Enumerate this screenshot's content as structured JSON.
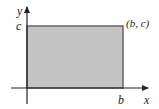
{
  "diagram": {
    "type": "rectangle-region",
    "axes": {
      "x_label": "x",
      "y_label": "y"
    },
    "ticks": {
      "x_tick": "b",
      "y_tick": "c"
    },
    "corner_point_label": "(b, c)",
    "colors": {
      "fill": "#c4c4c4",
      "stroke": "#555555",
      "axis": "#222222"
    }
  }
}
